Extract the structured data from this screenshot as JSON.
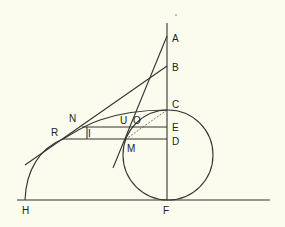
{
  "diagram": {
    "colors": {
      "background": "#fcfcee",
      "stroke": "#333333"
    },
    "points": {
      "A": {
        "label": "A"
      },
      "B": {
        "label": "B"
      },
      "C": {
        "label": "C"
      },
      "E": {
        "label": "E"
      },
      "D": {
        "label": "D"
      },
      "F": {
        "label": "F"
      },
      "H": {
        "label": "H"
      },
      "N": {
        "label": "N"
      },
      "R": {
        "label": "R"
      },
      "I": {
        "label": "I"
      },
      "U": {
        "label": "U"
      },
      "O": {
        "label": "O"
      },
      "M": {
        "label": "M"
      }
    }
  }
}
